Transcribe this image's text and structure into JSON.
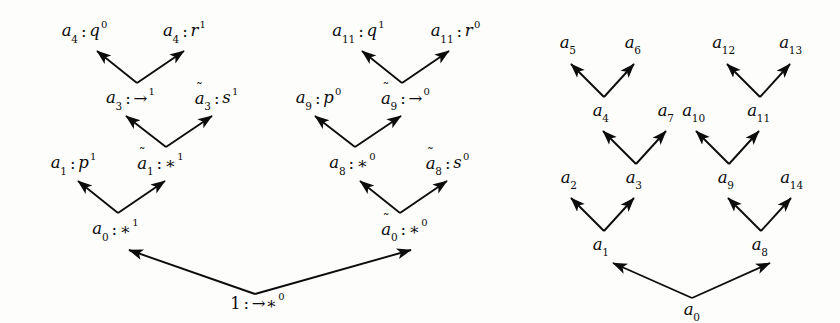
{
  "figure": {
    "background_color": "#fdfdfc",
    "ink_color": "#0c0c0c",
    "width": 840,
    "height": 323,
    "edge_style": "solid straight arrow, arrowhead at target (upward)"
  },
  "left_tree": {
    "name": "labelled-derivation-tree",
    "root": {
      "base": "1",
      "sep": ":",
      "term": "→∗",
      "level": "0"
    },
    "nodes": [
      {
        "id": "a0",
        "tilde": false,
        "base": "a",
        "sub": "0",
        "sep": ":",
        "term": "∗",
        "level": "1"
      },
      {
        "id": "a0t",
        "tilde": true,
        "base": "a",
        "sub": "0",
        "sep": ":",
        "term": "∗",
        "level": "0"
      },
      {
        "id": "a1",
        "tilde": false,
        "base": "a",
        "sub": "1",
        "sep": ":",
        "term": "p",
        "level": "1"
      },
      {
        "id": "a1t",
        "tilde": true,
        "base": "a",
        "sub": "1",
        "sep": ":",
        "term": "∗",
        "level": "1"
      },
      {
        "id": "a3",
        "tilde": false,
        "base": "a",
        "sub": "3",
        "sep": ":",
        "term": "→",
        "level": "1"
      },
      {
        "id": "a3t",
        "tilde": true,
        "base": "a",
        "sub": "3",
        "sep": ":",
        "term": "s",
        "level": "1"
      },
      {
        "id": "a4q",
        "tilde": false,
        "base": "a",
        "sub": "4",
        "sep": ":",
        "term": "q",
        "level": "0"
      },
      {
        "id": "a4r",
        "tilde": false,
        "base": "a",
        "sub": "4",
        "sep": ":",
        "term": "r",
        "level": "1"
      },
      {
        "id": "a8",
        "tilde": false,
        "base": "a",
        "sub": "8",
        "sep": ":",
        "term": "∗",
        "level": "0"
      },
      {
        "id": "a8t",
        "tilde": true,
        "base": "a",
        "sub": "8",
        "sep": ":",
        "term": "s",
        "level": "0"
      },
      {
        "id": "a9",
        "tilde": false,
        "base": "a",
        "sub": "9",
        "sep": ":",
        "term": "p",
        "level": "0"
      },
      {
        "id": "a9t",
        "tilde": true,
        "base": "a",
        "sub": "9",
        "sep": ":",
        "term": "→",
        "level": "0"
      },
      {
        "id": "a11q",
        "tilde": false,
        "base": "a",
        "sub": "11",
        "sep": ":",
        "term": "q",
        "level": "1"
      },
      {
        "id": "a11r",
        "tilde": false,
        "base": "a",
        "sub": "11",
        "sep": ":",
        "term": "r",
        "level": "0"
      }
    ]
  },
  "right_tree": {
    "name": "plain-node-tree",
    "nodes": [
      {
        "id": "r_a0",
        "base": "a",
        "sub": "0"
      },
      {
        "id": "r_a1",
        "base": "a",
        "sub": "1"
      },
      {
        "id": "r_a8",
        "base": "a",
        "sub": "8"
      },
      {
        "id": "r_a2",
        "base": "a",
        "sub": "2"
      },
      {
        "id": "r_a3",
        "base": "a",
        "sub": "3"
      },
      {
        "id": "r_a9",
        "base": "a",
        "sub": "9"
      },
      {
        "id": "r_a14",
        "base": "a",
        "sub": "14"
      },
      {
        "id": "r_a4",
        "base": "a",
        "sub": "4"
      },
      {
        "id": "r_a7",
        "base": "a",
        "sub": "7"
      },
      {
        "id": "r_a10",
        "base": "a",
        "sub": "10"
      },
      {
        "id": "r_a11",
        "base": "a",
        "sub": "11"
      },
      {
        "id": "r_a5",
        "base": "a",
        "sub": "5"
      },
      {
        "id": "r_a6",
        "base": "a",
        "sub": "6"
      },
      {
        "id": "r_a12",
        "base": "a",
        "sub": "12"
      },
      {
        "id": "r_a13",
        "base": "a",
        "sub": "13"
      }
    ]
  }
}
